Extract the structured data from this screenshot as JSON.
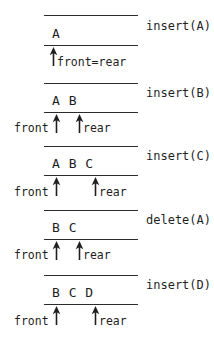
{
  "figure": {
    "ink_color": "#2b2b2b",
    "background_color": "#ffffff"
  },
  "stages": [
    {
      "id": "stage-1",
      "operation": "insert(A)",
      "cells": "A",
      "pointers": [
        {
          "name": "front=rear",
          "label": "front=rear"
        }
      ]
    },
    {
      "id": "stage-2",
      "operation": "insert(B)",
      "cells": "A B",
      "pointers": [
        {
          "name": "front",
          "label": "front"
        },
        {
          "name": "rear",
          "label": "rear"
        }
      ]
    },
    {
      "id": "stage-3",
      "operation": "insert(C)",
      "cells": "A B C",
      "pointers": [
        {
          "name": "front",
          "label": "front"
        },
        {
          "name": "rear",
          "label": "rear"
        }
      ]
    },
    {
      "id": "stage-4",
      "operation": "delete(A)",
      "cells": "B C",
      "pointers": [
        {
          "name": "front",
          "label": "front"
        },
        {
          "name": "rear",
          "label": "rear"
        }
      ]
    },
    {
      "id": "stage-5",
      "operation": "insert(D)",
      "cells": "B C D",
      "pointers": [
        {
          "name": "front",
          "label": "front"
        },
        {
          "name": "rear",
          "label": "rear"
        }
      ]
    }
  ]
}
